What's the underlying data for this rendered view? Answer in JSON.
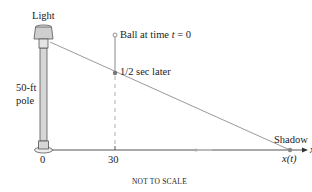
{
  "diagram": {
    "labels": {
      "light": "Light",
      "pole_line1": "50-ft",
      "pole_line2": "pole",
      "ball_prefix": "Ball at time ",
      "ball_var": "t",
      "ball_suffix": " = 0",
      "half_sec": "1/2 sec later",
      "shadow": "Shadow",
      "shadow_pos": "x(t)",
      "axis_var": "x",
      "tick_0": "0",
      "tick_30": "30",
      "footer": "NOT TO SCALE"
    },
    "colors": {
      "line": "#8a8a8a",
      "pole_fill": "#d6d6d6",
      "lamp_fill": "#cfcfcf",
      "dot": "#7a7a7a",
      "text": "#222222"
    }
  }
}
